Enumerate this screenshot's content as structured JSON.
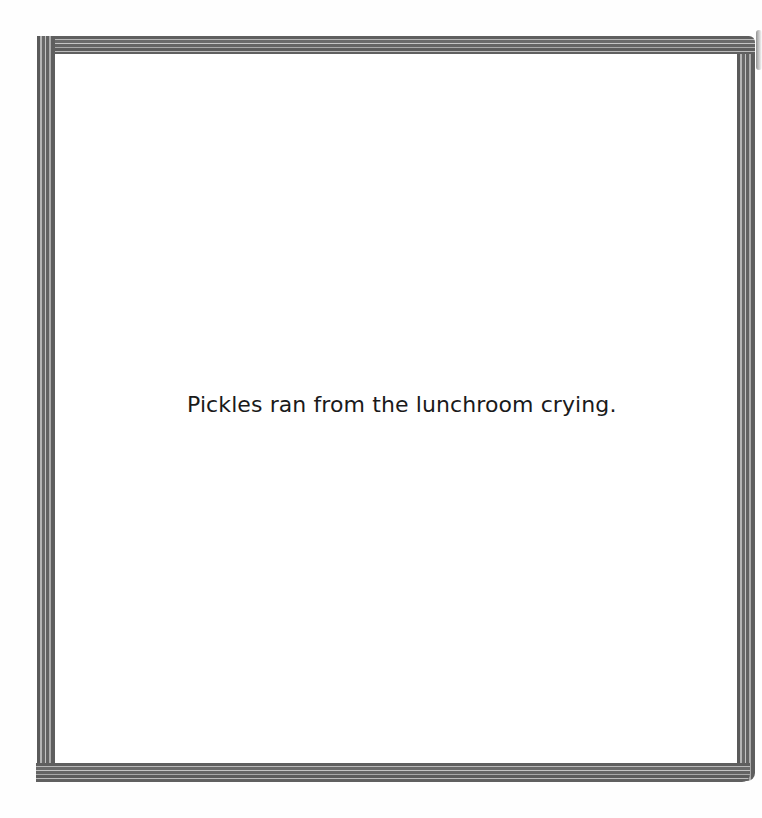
{
  "page": {
    "type": "picture-book-page",
    "frame": {
      "style": "striped-grey-border",
      "colors": {
        "dark_stripe": "#5f5f5f",
        "light_stripe": "#bcbcbc",
        "background": "#ffffff"
      }
    },
    "text": "Pickles ran from the lunchroom crying."
  }
}
